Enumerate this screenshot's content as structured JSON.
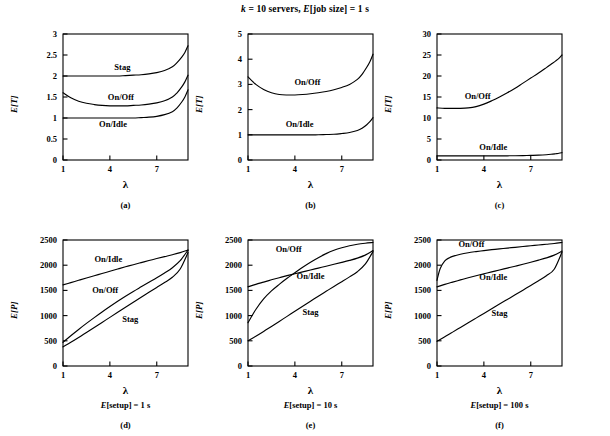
{
  "figure": {
    "super_title": "k = 10 servers, E[job size] = 1 s",
    "super_title_parts": {
      "k": "k",
      "eq1": " = 10 servers, ",
      "E": "E",
      "jobsize": "[job size] = 1 s"
    }
  },
  "axis_titles": {
    "lambda": "λ",
    "ET": "E[T]",
    "EP": "E[P]"
  },
  "captions": {
    "a": "(a)",
    "b": "(b)",
    "c": "(c)",
    "d": "(d)",
    "e": "(e)",
    "f": "(f)"
  },
  "setup_labels": {
    "d": "E[setup] = 1 s",
    "e": "E[setup] = 10 s",
    "f": "E[setup] = 100 s"
  },
  "series_names": {
    "stag": "Stag",
    "onoff": "On/Off",
    "onidle": "On/Idle"
  },
  "chart_data": [
    {
      "id": "a",
      "type": "line",
      "title": "(a)",
      "xlabel": "λ",
      "ylabel": "E[T]",
      "xlim": [
        1,
        9
      ],
      "ylim": [
        0,
        3
      ],
      "xticks": [
        1,
        4,
        7
      ],
      "yticks": [
        0,
        0.5,
        1,
        1.5,
        2,
        2.5,
        3
      ],
      "grid": false,
      "legend": "inline-labels",
      "x": [
        1,
        1.5,
        2,
        2.5,
        3,
        3.5,
        4,
        4.5,
        5,
        5.5,
        6,
        6.5,
        7,
        7.5,
        8,
        8.3,
        8.6,
        8.8,
        9
      ],
      "series": [
        {
          "name": "Stag",
          "label_at": [
            4.8,
            2.22
          ],
          "values": [
            2.0,
            2.0,
            2.0,
            2.0,
            2.0,
            2.0,
            2.0,
            2.0,
            2.01,
            2.02,
            2.03,
            2.05,
            2.08,
            2.13,
            2.22,
            2.32,
            2.45,
            2.56,
            2.72
          ]
        },
        {
          "name": "On/Off",
          "label_at": [
            4.7,
            1.5
          ],
          "values": [
            1.6,
            1.48,
            1.4,
            1.35,
            1.32,
            1.3,
            1.29,
            1.29,
            1.29,
            1.3,
            1.31,
            1.33,
            1.36,
            1.41,
            1.5,
            1.6,
            1.74,
            1.86,
            2.02
          ]
        },
        {
          "name": "On/Idle",
          "label_at": [
            4.2,
            0.86
          ],
          "values": [
            1.0,
            1.0,
            1.0,
            1.0,
            1.0,
            1.0,
            1.0,
            1.0,
            1.0,
            1.0,
            1.01,
            1.02,
            1.04,
            1.08,
            1.15,
            1.24,
            1.38,
            1.5,
            1.67
          ]
        }
      ]
    },
    {
      "id": "b",
      "type": "line",
      "title": "(b)",
      "xlabel": "λ",
      "ylabel": "E[T]",
      "xlim": [
        1,
        9
      ],
      "ylim": [
        0,
        5
      ],
      "xticks": [
        1,
        4,
        7
      ],
      "yticks": [
        0,
        1,
        2,
        3,
        4,
        5
      ],
      "grid": false,
      "legend": "inline-labels",
      "x": [
        1,
        1.5,
        2,
        2.5,
        3,
        3.5,
        4,
        4.5,
        5,
        5.5,
        6,
        6.5,
        7,
        7.5,
        8,
        8.3,
        8.6,
        8.8,
        9
      ],
      "series": [
        {
          "name": "On/Off",
          "label_at": [
            4.8,
            3.1
          ],
          "values": [
            3.3,
            3.0,
            2.8,
            2.67,
            2.6,
            2.58,
            2.58,
            2.6,
            2.63,
            2.67,
            2.72,
            2.79,
            2.88,
            3.0,
            3.2,
            3.4,
            3.68,
            3.9,
            4.2
          ]
        },
        {
          "name": "On/Idle",
          "label_at": [
            4.3,
            1.42
          ],
          "values": [
            1.0,
            1.0,
            1.0,
            1.0,
            1.0,
            1.0,
            1.0,
            1.0,
            1.0,
            1.0,
            1.01,
            1.02,
            1.05,
            1.09,
            1.17,
            1.26,
            1.4,
            1.52,
            1.68
          ]
        }
      ]
    },
    {
      "id": "c",
      "type": "line",
      "title": "(c)",
      "xlabel": "λ",
      "ylabel": "E[T]",
      "xlim": [
        1,
        9
      ],
      "ylim": [
        0,
        30
      ],
      "xticks": [
        1,
        4,
        7
      ],
      "yticks": [
        0,
        5,
        10,
        15,
        20,
        25,
        30
      ],
      "grid": false,
      "legend": "inline-labels",
      "x": [
        1,
        1.5,
        2,
        2.5,
        3,
        3.5,
        4,
        4.5,
        5,
        5.5,
        6,
        6.5,
        7,
        7.5,
        8,
        8.3,
        8.6,
        8.8,
        9
      ],
      "series": [
        {
          "name": "On/Off",
          "label_at": [
            3.6,
            15.2
          ],
          "values": [
            12.4,
            12.3,
            12.3,
            12.3,
            12.4,
            12.7,
            13.3,
            14.1,
            15.0,
            16.0,
            17.1,
            18.3,
            19.5,
            20.7,
            22.0,
            22.8,
            23.6,
            24.2,
            25.0
          ]
        },
        {
          "name": "On/Idle",
          "label_at": [
            4.6,
            3.2
          ],
          "values": [
            1.0,
            1.0,
            1.0,
            1.0,
            1.0,
            1.0,
            1.0,
            1.0,
            1.0,
            1.0,
            1.02,
            1.05,
            1.1,
            1.16,
            1.26,
            1.36,
            1.5,
            1.6,
            1.75
          ]
        }
      ]
    },
    {
      "id": "d",
      "type": "line",
      "title": "(d)",
      "xlabel": "λ",
      "ylabel": "E[P]",
      "sublabel": "E[setup] = 1 s",
      "xlim": [
        1,
        9
      ],
      "ylim": [
        0,
        2500
      ],
      "xticks": [
        1,
        4,
        7
      ],
      "yticks": [
        0,
        500,
        1000,
        1500,
        2000,
        2500
      ],
      "grid": false,
      "legend": "inline-labels",
      "x": [
        1,
        1.5,
        2,
        2.5,
        3,
        3.5,
        4,
        4.5,
        5,
        5.5,
        6,
        6.5,
        7,
        7.5,
        8,
        8.5,
        9
      ],
      "series": [
        {
          "name": "On/Idle",
          "label_at": [
            3.9,
            2130
          ],
          "values": [
            1610,
            1655,
            1700,
            1745,
            1790,
            1835,
            1880,
            1925,
            1968,
            2010,
            2052,
            2092,
            2132,
            2170,
            2208,
            2250,
            2300
          ]
        },
        {
          "name": "On/Off",
          "label_at": [
            3.7,
            1510
          ],
          "values": [
            470,
            600,
            725,
            845,
            960,
            1072,
            1180,
            1285,
            1385,
            1480,
            1570,
            1660,
            1750,
            1845,
            1950,
            2090,
            2300
          ]
        },
        {
          "name": "Stag",
          "label_at": [
            5.3,
            935
          ],
          "values": [
            380,
            470,
            565,
            665,
            765,
            865,
            965,
            1065,
            1165,
            1265,
            1365,
            1462,
            1558,
            1655,
            1760,
            1925,
            2250
          ]
        }
      ]
    },
    {
      "id": "e",
      "type": "line",
      "title": "(e)",
      "xlabel": "λ",
      "ylabel": "E[P]",
      "sublabel": "E[setup] = 10 s",
      "xlim": [
        1,
        9
      ],
      "ylim": [
        0,
        2500
      ],
      "xticks": [
        1,
        4,
        7
      ],
      "yticks": [
        0,
        500,
        1000,
        1500,
        2000,
        2500
      ],
      "grid": false,
      "legend": "inline-labels",
      "x": [
        1,
        1.5,
        2,
        2.5,
        3,
        3.5,
        4,
        4.5,
        5,
        5.5,
        6,
        6.5,
        7,
        7.5,
        8,
        8.5,
        9
      ],
      "series": [
        {
          "name": "On/Off",
          "label_at": [
            3.6,
            2330
          ],
          "values": [
            860,
            1120,
            1330,
            1490,
            1620,
            1740,
            1850,
            1960,
            2060,
            2150,
            2230,
            2295,
            2345,
            2385,
            2415,
            2435,
            2450
          ]
        },
        {
          "name": "On/Idle",
          "label_at": [
            5.0,
            1790
          ],
          "values": [
            1570,
            1620,
            1665,
            1710,
            1752,
            1792,
            1830,
            1868,
            1905,
            1942,
            1980,
            2018,
            2055,
            2095,
            2140,
            2200,
            2290
          ]
        },
        {
          "name": "Stag",
          "label_at": [
            5.0,
            1080
          ],
          "values": [
            500,
            590,
            685,
            785,
            885,
            985,
            1085,
            1185,
            1285,
            1385,
            1482,
            1578,
            1672,
            1768,
            1870,
            2020,
            2270
          ]
        }
      ]
    },
    {
      "id": "f",
      "type": "line",
      "title": "(f)",
      "xlabel": "λ",
      "ylabel": "E[P]",
      "sublabel": "E[setup] = 100 s",
      "xlim": [
        1,
        9
      ],
      "ylim": [
        0,
        2500
      ],
      "xticks": [
        1,
        4,
        7
      ],
      "yticks": [
        0,
        500,
        1000,
        1500,
        2000,
        2500
      ],
      "grid": false,
      "legend": "inline-labels",
      "x": [
        1,
        1.2,
        1.5,
        1.8,
        2,
        2.5,
        3,
        3.5,
        4,
        4.5,
        5,
        5.5,
        6,
        6.5,
        7,
        7.5,
        8,
        8.5,
        9
      ],
      "series": [
        {
          "name": "On/Off",
          "label_at": [
            3.2,
            2420
          ],
          "values": [
            1700,
            1930,
            2085,
            2150,
            2175,
            2218,
            2248,
            2270,
            2290,
            2308,
            2325,
            2340,
            2355,
            2370,
            2385,
            2400,
            2415,
            2430,
            2450
          ]
        },
        {
          "name": "On/Idle",
          "label_at": [
            4.6,
            1760
          ],
          "values": [
            1570,
            1590,
            1620,
            1648,
            1665,
            1708,
            1750,
            1790,
            1830,
            1868,
            1905,
            1942,
            1980,
            2018,
            2058,
            2100,
            2145,
            2200,
            2280
          ]
        },
        {
          "name": "Stag",
          "label_at": [
            5.0,
            1060
          ],
          "values": [
            490,
            525,
            580,
            635,
            672,
            765,
            858,
            950,
            1042,
            1135,
            1228,
            1320,
            1412,
            1505,
            1598,
            1690,
            1790,
            1920,
            2260
          ]
        }
      ]
    }
  ]
}
